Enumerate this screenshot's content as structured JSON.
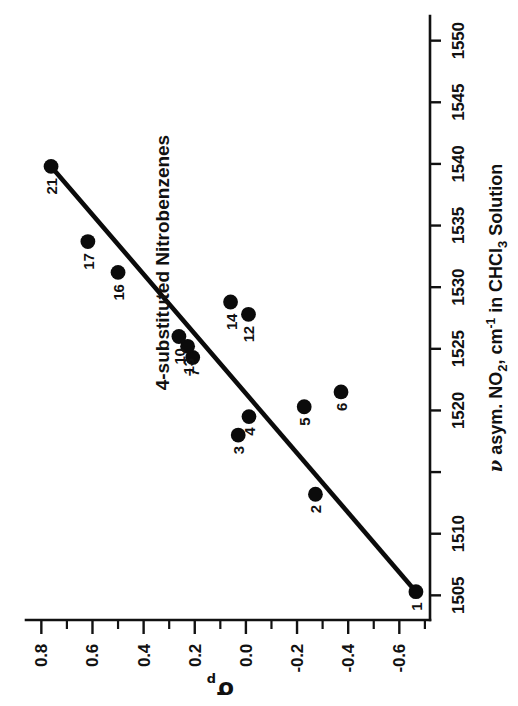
{
  "chart_data": {
    "type": "scatter",
    "title": "4-substituted Nitrobenzenes",
    "xlabel": "v asym. NO2, cm-1 in CHCl3 Solution",
    "xlabel_parts": {
      "nu": "ν",
      "mid": " asym. NO",
      "sub2": "2",
      "comma": ", cm",
      "sup": "-1",
      "tail": " in CHCl",
      "sub3": "3",
      "end": " Solution"
    },
    "ylabel": "σp",
    "ylabel_parts": {
      "symbol": "σ",
      "subscript": "p"
    },
    "xlim": [
      1503.0,
      1552.0
    ],
    "ylim": [
      -0.72,
      0.86
    ],
    "xticks": [
      1505,
      1510,
      1515,
      1520,
      1525,
      1530,
      1535,
      1540,
      1545,
      1550
    ],
    "xticklabels": [
      "1505",
      "1510",
      "",
      "1520",
      "1525",
      "1530",
      "1535",
      "1540",
      "1545",
      "1550"
    ],
    "yticks_major": [
      -0.6,
      -0.4,
      -0.2,
      0.0,
      0.2,
      0.4,
      0.6,
      0.8
    ],
    "yticklabels": [
      "-0.6",
      "-0.4",
      "-0.2",
      "0.0",
      "0.2",
      "0.4",
      "0.6",
      "0.8"
    ],
    "yticks_minor": [
      -0.7,
      -0.5,
      -0.3,
      -0.1,
      0.1,
      0.3,
      0.5,
      0.7
    ],
    "grid": false,
    "legend": null,
    "marker_color": "#0b0b0b",
    "line_color": "#0b0b0b",
    "fit_line": {
      "x": [
        1505.3,
        1539.8
      ],
      "y": [
        -0.665,
        0.762
      ]
    },
    "points": [
      {
        "label": "1",
        "x": 1505.3,
        "y": -0.665,
        "lx": -15,
        "ly": 1
      },
      {
        "label": "2",
        "x": 1513.2,
        "y": -0.272,
        "lx": -15,
        "ly": 1
      },
      {
        "label": "3",
        "x": 1518.0,
        "y": 0.03,
        "lx": -15,
        "ly": 1
      },
      {
        "label": "4",
        "x": 1519.5,
        "y": -0.012,
        "lx": -15,
        "ly": 1
      },
      {
        "label": "5",
        "x": 1520.3,
        "y": -0.228,
        "lx": -15,
        "ly": 1
      },
      {
        "label": "6",
        "x": 1521.5,
        "y": -0.372,
        "lx": -15,
        "ly": 1
      },
      {
        "label": "7",
        "x": 1524.3,
        "y": 0.208,
        "lx": -15,
        "ly": 1
      },
      {
        "label": "13",
        "x": 1525.2,
        "y": 0.228,
        "lx": -20,
        "ly": 1
      },
      {
        "label": "10",
        "x": 1526.0,
        "y": 0.262,
        "lx": -20,
        "ly": 1
      },
      {
        "label": "12",
        "x": 1527.8,
        "y": -0.01,
        "lx": -20,
        "ly": 1
      },
      {
        "label": "14",
        "x": 1528.8,
        "y": 0.06,
        "lx": -20,
        "ly": 1
      },
      {
        "label": "16",
        "x": 1531.2,
        "y": 0.5,
        "lx": -20,
        "ly": 1
      },
      {
        "label": "17",
        "x": 1533.7,
        "y": 0.618,
        "lx": -20,
        "ly": 1
      },
      {
        "label": "21",
        "x": 1539.8,
        "y": 0.762,
        "lx": -20,
        "ly": 1
      }
    ]
  }
}
